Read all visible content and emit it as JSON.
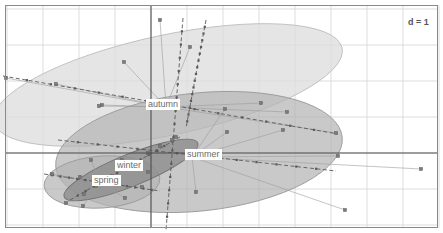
{
  "chart_data": {
    "type": "scatter",
    "title": "",
    "subtitle": "",
    "xlabel": "",
    "ylabel": "",
    "annotations": [
      {
        "name": "scale-bar-label",
        "text": "d = 1",
        "x": 408,
        "y": 17
      }
    ],
    "grid": {
      "on": true,
      "spacing_px": 36,
      "x_lines": [
        7,
        43,
        79,
        115,
        151,
        187,
        223,
        259,
        295,
        331,
        367,
        403,
        439
      ],
      "y_lines": [
        9,
        45,
        81,
        117,
        153,
        189,
        225
      ],
      "color": "#d4d4d4"
    },
    "axes": {
      "origin_x": 151,
      "origin_y": 153,
      "color": "#4d4d4d",
      "x_range": [
        -4.0,
        8.1
      ],
      "y_range": [
        -2.0,
        4.0
      ]
    },
    "frame": {
      "x": 5,
      "y": 5,
      "width": 433,
      "height": 223,
      "color": "#8a8a8a"
    },
    "legend": {
      "position": "none",
      "entries": []
    },
    "groups": [
      {
        "name": "autumn",
        "label": "autumn",
        "label_x": 146,
        "label_y": 99,
        "centroid": [
          166,
          107
        ],
        "fill": "#dcdcdc",
        "stroke": "#bfbfbf",
        "opacity": 0.75,
        "ellipse": {
          "cx": 168,
          "cy": 85,
          "rx": 178,
          "ry": 50,
          "rotation": -12
        },
        "points": [
          [
            124,
            62
          ],
          [
            99,
            106
          ],
          [
            6,
            78
          ],
          [
            160,
            20
          ],
          [
            190,
            47
          ],
          [
            261,
            103
          ],
          [
            287,
            112
          ],
          [
            336,
            133
          ],
          [
            102,
            105
          ],
          [
            56,
            84
          ]
        ],
        "axis_line": {
          "x1": 3,
          "y1": 76,
          "x2": 338,
          "y2": 134
        }
      },
      {
        "name": "summer",
        "label": "summer",
        "label_x": 185,
        "label_y": 149,
        "centroid": [
          192,
          157
        ],
        "fill": "#b4b4b4",
        "stroke": "#9a9a9a",
        "opacity": 0.72,
        "ellipse": {
          "cx": 199,
          "cy": 152,
          "rx": 144,
          "ry": 59,
          "rotation": -6
        },
        "points": [
          [
            227,
            132
          ],
          [
            283,
            130
          ],
          [
            338,
            156
          ],
          [
            421,
            169
          ],
          [
            345,
            210
          ],
          [
            196,
            192
          ],
          [
            148,
            172
          ],
          [
            122,
            160
          ],
          [
            225,
            109
          ]
        ],
        "axis_line": {
          "x1": 58,
          "y1": 140,
          "x2": 336,
          "y2": 171
        }
      },
      {
        "name": "spring",
        "label": "spring",
        "label_x": 92,
        "label_y": 175,
        "centroid": [
          100,
          183
        ],
        "fill": "#b4b4b4",
        "stroke": "#9a9a9a",
        "opacity": 0.72,
        "ellipse": {
          "cx": 102,
          "cy": 182,
          "rx": 58,
          "ry": 26,
          "rotation": -4
        },
        "points": [
          [
            66,
            203
          ],
          [
            83,
            206
          ],
          [
            91,
            160
          ],
          [
            125,
            198
          ],
          [
            142,
            187
          ],
          [
            80,
            177
          ],
          [
            52,
            174
          ]
        ],
        "axis_line": {
          "x1": 44,
          "y1": 174,
          "x2": 160,
          "y2": 191
        }
      },
      {
        "name": "winter",
        "label": "winter",
        "label_x": 115,
        "label_y": 160,
        "centroid": [
          125,
          169
        ],
        "fill": "#8c8c8c",
        "stroke": "#707070",
        "opacity": 0.78,
        "ellipse": {
          "cx": 131,
          "cy": 170,
          "rx": 72,
          "ry": 16,
          "rotation": -22
        },
        "points": [
          [
            172,
            140
          ],
          [
            160,
            146
          ],
          [
            148,
            153
          ],
          [
            136,
            162
          ],
          [
            112,
            176
          ],
          [
            96,
            186
          ],
          [
            84,
            194
          ],
          [
            176,
            137
          ]
        ],
        "axis_line": {
          "x1": 70,
          "y1": 200,
          "x2": 180,
          "y2": 137
        }
      }
    ],
    "star_spokes": {
      "color": "#9b9b9b",
      "description": "lines connecting each group centroid to its member points"
    },
    "point_marker": {
      "shape": "square",
      "size": 3,
      "color": "#7a7a7a"
    }
  }
}
